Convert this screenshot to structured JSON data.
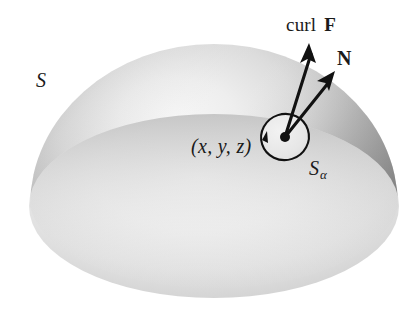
{
  "figure": {
    "background_color": "#ffffff",
    "width": 417,
    "height": 315
  },
  "labels": {
    "surface": "S",
    "curl_field_prefix": "curl ",
    "curl_field_vector": "F",
    "normal_vector": "N",
    "point": "(x, y, z)",
    "patch_base": "S",
    "patch_subscript": "α"
  },
  "colors": {
    "ink": "#1a1a1a",
    "dome_highlight": "#f2f2f2",
    "dome_midtone": "#bdbdbd",
    "dome_shadow": "#8e8e8e",
    "dome_edge": "#7c7c7c",
    "base_highlight": "#f4f4f4",
    "base_midtone": "#d9d9d9",
    "base_shadow": "#c0c0c0",
    "patch_fill": "#e9e9e9",
    "stroke": "#111111"
  },
  "geometry": {
    "dome": {
      "apex_x": 214,
      "apex_y": 44,
      "left_x": 30,
      "right_x": 400,
      "rim_y_center": 190
    },
    "base_ellipse": {
      "center_x": 214,
      "center_y": 206,
      "radius_x": 185,
      "radius_y": 92
    },
    "patch_circle": {
      "center_x": 285,
      "center_y": 137,
      "radius_x": 24,
      "radius_y": 23,
      "rotation_deg": -18
    },
    "point_dot": {
      "x": 285,
      "y": 137,
      "radius": 4.5
    },
    "curl_arrow": {
      "from_x": 285,
      "from_y": 137,
      "to_x": 309,
      "to_y": 47
    },
    "normal_arrow": {
      "from_x": 285,
      "from_y": 137,
      "to_x": 332,
      "to_y": 75
    }
  }
}
